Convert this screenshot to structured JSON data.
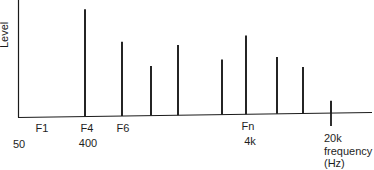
{
  "chart_data": {
    "type": "bar",
    "subtype": "line-spectrum",
    "title": "",
    "xlabel": "frequency (Hz)",
    "ylabel": "Level",
    "xscale": "log",
    "grid": false,
    "legend": null,
    "x_tick_labels_top": [
      "F1",
      "F4",
      "F6",
      "Fn"
    ],
    "x_tick_labels_bottom": [
      "50",
      "400",
      "4k",
      "20k"
    ],
    "axis_end_label": [
      "20k",
      "frequency",
      "(Hz)"
    ],
    "ylim": [
      0,
      100
    ],
    "spectral_lines": [
      {
        "label": "F4",
        "freq_hz": 400,
        "level": 92
      },
      {
        "label": "F6",
        "freq_hz": 600,
        "level": 64
      },
      {
        "label": "",
        "freq_hz": 1000,
        "level": 43
      },
      {
        "label": "",
        "freq_hz": 1500,
        "level": 61
      },
      {
        "label": "",
        "freq_hz": 2800,
        "level": 48
      },
      {
        "label": "Fn",
        "freq_hz": 4000,
        "level": 69
      },
      {
        "label": "",
        "freq_hz": 6500,
        "level": 50
      },
      {
        "label": "",
        "freq_hz": 10000,
        "level": 41
      },
      {
        "label": "20k",
        "freq_hz": 20000,
        "level": 11
      }
    ]
  },
  "labels": {
    "ylabel": "Level",
    "F1": "F1",
    "F4": "F4",
    "F6": "F6",
    "Fn": "Fn",
    "f50": "50",
    "f400": "400",
    "f4k": "4k",
    "f20k": "20k",
    "frequency": "frequency",
    "hz": "(Hz)"
  },
  "colors": {
    "line": "#1a1a1a",
    "background": "#ffffff"
  }
}
